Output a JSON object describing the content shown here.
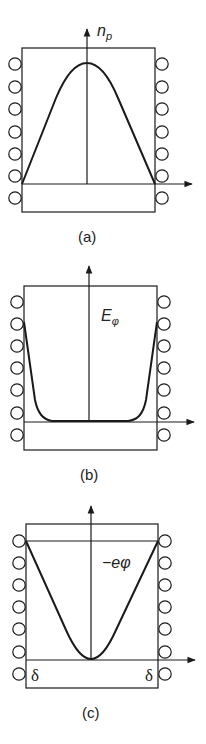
{
  "panels": [
    {
      "id": "a",
      "caption": "(a)",
      "quantity_label": "n",
      "quantity_subscript": "p",
      "curve_shape": "bell / dome profile peaking at center, zero at walls"
    },
    {
      "id": "b",
      "caption": "(b)",
      "quantity_label": "E",
      "quantity_subscript": "φ",
      "curve_shape": "near zero in center, rising steeply at both walls"
    },
    {
      "id": "c",
      "caption": "(c)",
      "quantity_label": "−eφ",
      "quantity_subscript": "",
      "curve_shape": "parabolic well, minimum at center, maximum at walls",
      "wall_labels": [
        "δ",
        "δ"
      ]
    }
  ],
  "colors": {
    "line": "#1a1a1a",
    "background": "#ffffff"
  }
}
